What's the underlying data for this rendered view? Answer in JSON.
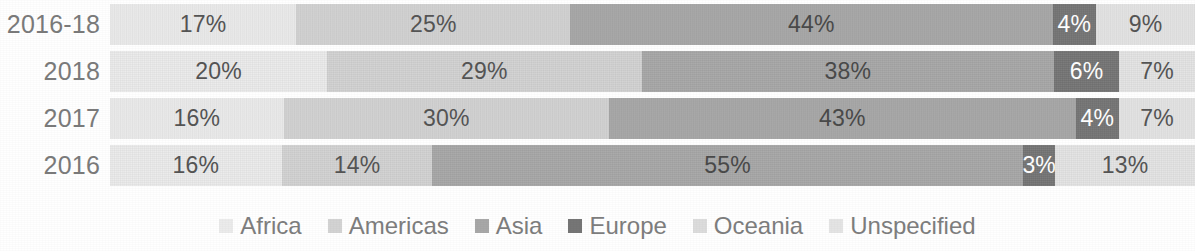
{
  "chart_data": {
    "type": "bar",
    "orientation": "horizontal",
    "stacked": true,
    "normalized": "percent",
    "title": "",
    "subtitle": "",
    "xlabel": "",
    "ylabel": "",
    "xlim": [
      0,
      100
    ],
    "grid": false,
    "legend_position": "bottom",
    "categories": [
      "2016-18",
      "2018",
      "2017",
      "2016"
    ],
    "series": [
      {
        "name": "Africa",
        "color": "#ebebeb",
        "label_color": "#555555",
        "values": [
          17,
          20,
          16,
          16
        ]
      },
      {
        "name": "Americas",
        "color": "#d3d3d3",
        "label_color": "#555555",
        "values": [
          25,
          29,
          30,
          14
        ]
      },
      {
        "name": "Asia",
        "color": "#a8a8a8",
        "label_color": "#4a4a4a",
        "values": [
          44,
          38,
          43,
          55
        ]
      },
      {
        "name": "Europe",
        "color": "#767676",
        "label_color": "#ffffff",
        "values": [
          4,
          6,
          4,
          3
        ]
      },
      {
        "name": "Oceania",
        "color": "#dcdcdc",
        "label_color": "#555555",
        "values": [
          0,
          0,
          0,
          0
        ]
      },
      {
        "name": "Unspecified",
        "color": "#e4e4e4",
        "label_color": "#555555",
        "values": [
          9,
          7,
          7,
          13
        ]
      }
    ],
    "rows": [
      {
        "category": "2016-18",
        "segments": [
          {
            "series": "Africa",
            "value": 17,
            "label": "17%",
            "show_label": true
          },
          {
            "series": "Americas",
            "value": 25,
            "label": "25%",
            "show_label": true
          },
          {
            "series": "Asia",
            "value": 44,
            "label": "44%",
            "show_label": true
          },
          {
            "series": "Europe",
            "value": 4,
            "label": "4%",
            "show_label": true
          },
          {
            "series": "Oceania",
            "value": 0,
            "label": "",
            "show_label": false
          },
          {
            "series": "Unspecified",
            "value": 9,
            "label": "9%",
            "show_label": true
          }
        ]
      },
      {
        "category": "2018",
        "segments": [
          {
            "series": "Africa",
            "value": 20,
            "label": "20%",
            "show_label": true
          },
          {
            "series": "Americas",
            "value": 29,
            "label": "29%",
            "show_label": true
          },
          {
            "series": "Asia",
            "value": 38,
            "label": "38%",
            "show_label": true
          },
          {
            "series": "Europe",
            "value": 6,
            "label": "6%",
            "show_label": true
          },
          {
            "series": "Oceania",
            "value": 0,
            "label": "",
            "show_label": false
          },
          {
            "series": "Unspecified",
            "value": 7,
            "label": "7%",
            "show_label": true
          }
        ]
      },
      {
        "category": "2017",
        "segments": [
          {
            "series": "Africa",
            "value": 16,
            "label": "16%",
            "show_label": true
          },
          {
            "series": "Americas",
            "value": 30,
            "label": "30%",
            "show_label": true
          },
          {
            "series": "Asia",
            "value": 43,
            "label": "43%",
            "show_label": true
          },
          {
            "series": "Europe",
            "value": 4,
            "label": "4%",
            "show_label": true
          },
          {
            "series": "Oceania",
            "value": 0,
            "label": "",
            "show_label": false
          },
          {
            "series": "Unspecified",
            "value": 7,
            "label": "7%",
            "show_label": true
          }
        ]
      },
      {
        "category": "2016",
        "segments": [
          {
            "series": "Africa",
            "value": 16,
            "label": "16%",
            "show_label": true
          },
          {
            "series": "Americas",
            "value": 14,
            "label": "14%",
            "show_label": true
          },
          {
            "series": "Asia",
            "value": 55,
            "label": "55%",
            "show_label": true
          },
          {
            "series": "Europe",
            "value": 3,
            "label": "3%",
            "show_label": true
          },
          {
            "series": "Oceania",
            "value": 0,
            "label": "",
            "show_label": false
          },
          {
            "series": "Unspecified",
            "value": 13,
            "label": "13%",
            "show_label": true
          }
        ]
      }
    ],
    "legend": [
      {
        "label": "Africa",
        "color": "#ebebeb"
      },
      {
        "label": "Americas",
        "color": "#d3d3d3"
      },
      {
        "label": "Asia",
        "color": "#a8a8a8"
      },
      {
        "label": "Europe",
        "color": "#767676"
      },
      {
        "label": "Oceania",
        "color": "#dcdcdc"
      },
      {
        "label": "Unspecified",
        "color": "#e4e4e4"
      }
    ]
  }
}
